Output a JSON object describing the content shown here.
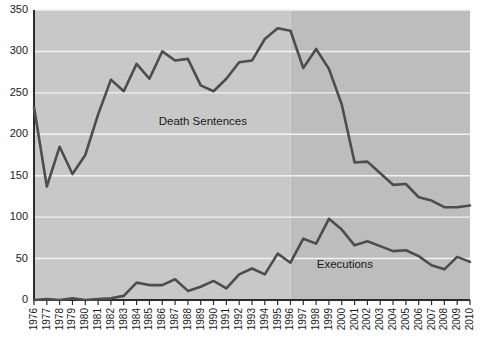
{
  "chart_data": {
    "type": "line",
    "title": "",
    "xlabel": "",
    "ylabel": "",
    "ylim": [
      0,
      350
    ],
    "yticks": [
      0,
      50,
      100,
      150,
      200,
      250,
      300,
      350
    ],
    "grid": true,
    "legend_position": "inline-annotations",
    "categories": [
      "1976",
      "1977",
      "1978",
      "1979",
      "1980",
      "1981",
      "1982",
      "1983",
      "1984",
      "1985",
      "1986",
      "1987",
      "1988",
      "1989",
      "1990",
      "1991",
      "1992",
      "1993",
      "1994",
      "1995",
      "1996",
      "1997",
      "1998",
      "1999",
      "2000",
      "2001",
      "2002",
      "2003",
      "2004",
      "2005",
      "2006",
      "2007",
      "2008",
      "2009",
      "2010"
    ],
    "series": [
      {
        "name": "Death Sentences",
        "color": "#4d4d4d",
        "values": [
          233,
          137,
          185,
          152,
          175,
          224,
          266,
          252,
          285,
          267,
          300,
          289,
          291,
          259,
          252,
          267,
          287,
          289,
          315,
          328,
          325,
          280,
          303,
          279,
          236,
          166,
          167,
          153,
          139,
          140,
          124,
          120,
          112,
          112,
          114
        ]
      },
      {
        "name": "Executions",
        "color": "#4d4d4d",
        "values": [
          0,
          1,
          0,
          2,
          0,
          1,
          2,
          5,
          21,
          18,
          18,
          25,
          11,
          16,
          23,
          14,
          31,
          38,
          31,
          56,
          45,
          74,
          68,
          98,
          85,
          66,
          71,
          65,
          59,
          60,
          53,
          42,
          37,
          52,
          46
        ]
      }
    ],
    "annotations": [
      {
        "text": "Death Sentences",
        "x_year": "1989",
        "y_value": 215
      },
      {
        "text": "Executions",
        "x_year": "2000",
        "y_value": 42
      }
    ],
    "shaded_regions": [
      {
        "from_year": "1976",
        "to_year": "1996",
        "color": "#c8c8c8"
      },
      {
        "from_year": "1996",
        "to_year": "2010",
        "color": "#bdbdbd"
      }
    ]
  },
  "axis": {
    "y_tick_labels": [
      "350",
      "300",
      "250",
      "200",
      "150",
      "100",
      "50",
      "0"
    ],
    "x_tick_labels": [
      "1976",
      "1977",
      "1978",
      "1979",
      "1980",
      "1981",
      "1982",
      "1983",
      "1984",
      "1985",
      "1986",
      "1987",
      "1988",
      "1989",
      "1990",
      "1991",
      "1992",
      "1993",
      "1994",
      "1995",
      "1996",
      "1997",
      "1998",
      "1999",
      "2000",
      "2001",
      "2002",
      "2003",
      "2004",
      "2005",
      "2006",
      "2007",
      "2008",
      "2009",
      "2010"
    ]
  },
  "labels": {
    "death_sentences": "Death Sentences",
    "executions": "Executions"
  },
  "colors": {
    "line": "#4d4d4d",
    "axis": "#2b2b2b",
    "plot_bg_left": "#c8c8c8",
    "plot_bg_right": "#bdbdbd",
    "gridline": "#f2f2f2",
    "text": "#1a1a1a"
  }
}
